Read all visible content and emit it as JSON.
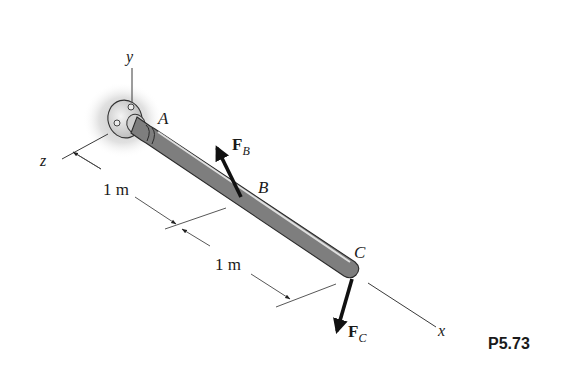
{
  "figure": {
    "problem_number": "P5.73",
    "axes": {
      "x": "x",
      "y": "y",
      "z": "z"
    },
    "points": {
      "A": "A",
      "B": "B",
      "C": "C"
    },
    "forces": {
      "FB": {
        "symbol": "F",
        "subscript": "B"
      },
      "FC": {
        "symbol": "F",
        "subscript": "C"
      }
    },
    "dimensions": [
      {
        "label": "1 m",
        "segment": "A-B"
      },
      {
        "label": "1 m",
        "segment": "B-C"
      }
    ],
    "colors": {
      "line": "#3a3a3a",
      "shaft_light": "#e6e6e6",
      "shaft_dark": "#8a8a8a",
      "arrow": "#111111",
      "wall_shadow": "#c8c8c8"
    }
  }
}
